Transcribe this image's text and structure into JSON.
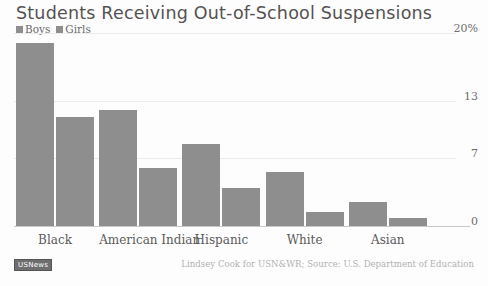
{
  "chart_data": {
    "type": "bar",
    "title": "Students Receiving Out-of-School Suspensions",
    "xlabel": "",
    "ylabel": "",
    "categories": [
      "Black",
      "American Indian",
      "Hispanic",
      "White",
      "Asian"
    ],
    "series": [
      {
        "name": "Boys",
        "values": [
          19.0,
          12.0,
          8.5,
          5.6,
          2.5
        ]
      },
      {
        "name": "Girls",
        "values": [
          11.3,
          6.0,
          3.9,
          1.5,
          0.8
        ]
      }
    ],
    "ylim": [
      0,
      20
    ],
    "yticks": [
      0,
      7,
      13,
      20
    ],
    "ytick_labels": [
      "0",
      "7",
      "13",
      "20%"
    ],
    "grid": true,
    "legend_position": "top-left",
    "bar_color": "#8e8e8e",
    "annotations": {
      "source": "Lindsey Cook for USN&WR; Source: U.S. Department of Education",
      "logo": "USNews"
    }
  },
  "legend": {
    "entries": [
      {
        "label": "Boys",
        "color": "#8e8e8e"
      },
      {
        "label": "Girls",
        "color": "#8e8e8e"
      }
    ]
  },
  "footer": {
    "source_text": "Lindsey Cook for USN&WR; Source: U.S. Department of Education",
    "logo_text": "USNews"
  }
}
